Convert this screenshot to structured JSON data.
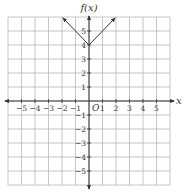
{
  "chart_data": {
    "type": "line",
    "title": "",
    "xlabel": "x",
    "ylabel": "f(x)",
    "origin_label": "O",
    "xlim": [
      -6,
      6
    ],
    "ylim": [
      -6,
      6
    ],
    "grid": true,
    "x_ticks": [
      -5,
      -4,
      -3,
      -2,
      -1,
      1,
      2,
      3,
      4,
      5
    ],
    "y_ticks": [
      -5,
      -4,
      -3,
      -2,
      -1,
      1,
      2,
      3,
      4,
      5
    ],
    "series": [
      {
        "name": "f(x) = |x| + 4",
        "points": [
          [
            -2,
            6
          ],
          [
            0,
            4
          ],
          [
            2,
            6
          ]
        ],
        "arrows": "both-ends"
      }
    ]
  },
  "colors": {
    "grid": "#b8b8b8",
    "axis": "#333333",
    "curve": "#333333"
  }
}
